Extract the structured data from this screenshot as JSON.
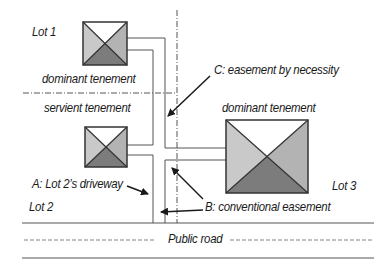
{
  "diagram": {
    "labels": {
      "lot1": "Lot 1",
      "lot2": "Lot 2",
      "lot3": "Lot 3",
      "dominant_tenement_lot1": "dominant tenement",
      "servient_tenement": "servient tenement",
      "dominant_tenement_lot3": "dominant tenement",
      "easement_c": "C: easement by necessity",
      "driveway_a": "A: Lot 2’s driveway",
      "easement_b": "B: conventional easement",
      "public_road": "Public road"
    },
    "colors": {
      "roof_light": "#c9c9c9",
      "roof_mid": "#a9a9a9",
      "roof_dark": "#7c7c7c",
      "roof_top": "#ffffff",
      "line": "#4a4a4a",
      "arrow": "#1a1a1a"
    }
  }
}
